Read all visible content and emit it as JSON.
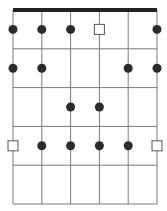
{
  "diagram": {
    "strings": 6,
    "frets": 5,
    "colors": {
      "line": "#7a7a7a",
      "nut": "#222222",
      "dot": "#2b2b2b",
      "root_outline": "#555555",
      "background": "#ffffff"
    },
    "markers": [
      {
        "string": 1,
        "fret": 1,
        "type": "dot"
      },
      {
        "string": 2,
        "fret": 1,
        "type": "dot"
      },
      {
        "string": 3,
        "fret": 1,
        "type": "dot"
      },
      {
        "string": 4,
        "fret": 1,
        "type": "root"
      },
      {
        "string": 6,
        "fret": 1,
        "type": "dot"
      },
      {
        "string": 1,
        "fret": 2,
        "type": "dot"
      },
      {
        "string": 2,
        "fret": 2,
        "type": "dot"
      },
      {
        "string": 5,
        "fret": 2,
        "type": "dot"
      },
      {
        "string": 6,
        "fret": 2,
        "type": "dot"
      },
      {
        "string": 3,
        "fret": 3,
        "type": "dot"
      },
      {
        "string": 4,
        "fret": 3,
        "type": "dot"
      },
      {
        "string": 1,
        "fret": 4,
        "type": "root"
      },
      {
        "string": 2,
        "fret": 4,
        "type": "dot"
      },
      {
        "string": 3,
        "fret": 4,
        "type": "dot"
      },
      {
        "string": 4,
        "fret": 4,
        "type": "dot"
      },
      {
        "string": 5,
        "fret": 4,
        "type": "dot"
      },
      {
        "string": 6,
        "fret": 4,
        "type": "root"
      }
    ]
  }
}
